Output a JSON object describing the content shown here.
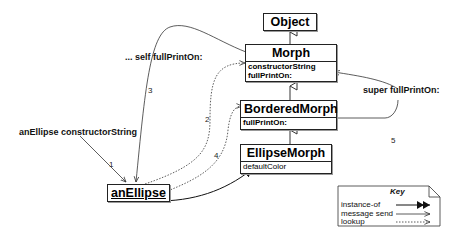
{
  "classes": {
    "object": {
      "name": "Object"
    },
    "morph": {
      "name": "Morph",
      "methods": [
        "constructorString",
        "fullPrintOn:"
      ]
    },
    "bordered": {
      "name": "BorderedMorph",
      "methods": [
        "fullPrintOn:"
      ]
    },
    "ellipse": {
      "name": "EllipseMorph",
      "methods": [
        "defaultColor"
      ]
    }
  },
  "instance": {
    "name": "anEllipse"
  },
  "labels": {
    "constructor_msg": "anEllipse constructorString",
    "self_msg": "... self fullPrintOn:",
    "super_msg": "super fullPrintOn:"
  },
  "steps": [
    "1",
    "2",
    "3",
    "4",
    "5"
  ],
  "key": {
    "title": "Key",
    "rows": [
      "instance-of",
      "message send",
      "lookup"
    ]
  }
}
